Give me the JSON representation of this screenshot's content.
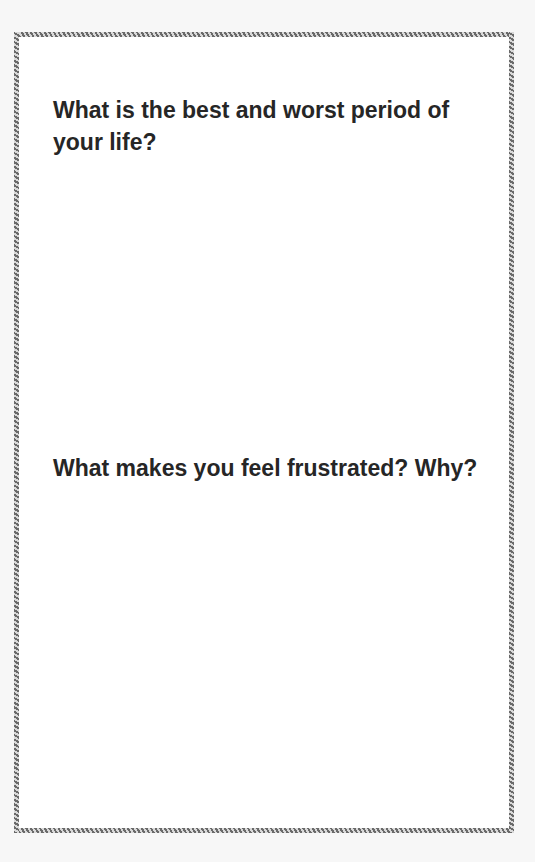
{
  "document": {
    "type": "journal-prompt-page",
    "questions": [
      {
        "text": "What is the best and worst period of your life?"
      },
      {
        "text": "What makes you feel frustrated? Why?"
      }
    ]
  },
  "colors": {
    "text": "#262626",
    "border_dark": "#6a6a6a",
    "border_light": "#d9d9d9",
    "page_background": "#ffffff",
    "outer_background": "#f7f7f7"
  }
}
